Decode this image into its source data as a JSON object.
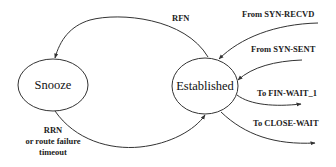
{
  "diagram": {
    "type": "state-transition",
    "states": [
      {
        "id": "snooze",
        "label": "Snooze"
      },
      {
        "id": "established",
        "label": "Established"
      }
    ],
    "transitions": [
      {
        "id": "rfn",
        "from": "established",
        "to": "snooze",
        "label": "RFN"
      },
      {
        "id": "rrn",
        "from": "snooze",
        "to": "established",
        "label_lines": [
          "RRN",
          "or route failure",
          "timeout"
        ]
      },
      {
        "id": "from-syn-recvd",
        "to": "established",
        "label": "From SYN-RECVD"
      },
      {
        "id": "from-syn-sent",
        "to": "established",
        "label": "From SYN-SENT"
      },
      {
        "id": "to-fin-wait-1",
        "from": "established",
        "label": "To FIN-WAIT_1"
      },
      {
        "id": "to-close-wait",
        "from": "established",
        "label": "To CLOSE-WAIT"
      }
    ]
  },
  "colors": {
    "stroke": "#333333",
    "text": "#222222",
    "background": "#ffffff"
  }
}
